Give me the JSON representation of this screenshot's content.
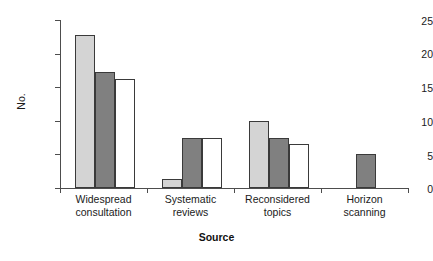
{
  "chart_data": {
    "type": "bar",
    "title": "",
    "xlabel": "Source",
    "ylabel": "No.",
    "ylim": [
      0,
      25
    ],
    "yticks": [
      0,
      5,
      10,
      15,
      20,
      25
    ],
    "ytick_labels": [
      "0",
      "5",
      "10",
      "15",
      "20",
      "25"
    ],
    "grid": false,
    "legend": "none",
    "categories": [
      "Widespread\nconsultation",
      "Systematic\nreviews",
      "Reconsidered\ntopics",
      "Horizon\nscanning"
    ],
    "category_lines": [
      [
        "Widespread",
        "consultation"
      ],
      [
        "Systematic",
        "reviews"
      ],
      [
        "Reconsidered",
        "topics"
      ],
      [
        "Horizon",
        "scanning"
      ]
    ],
    "series": [
      {
        "name": "Series 1",
        "color": "#d4d4d4",
        "values": [
          22.8,
          1.3,
          10.0,
          null
        ]
      },
      {
        "name": "Series 2",
        "color": "#808080",
        "values": [
          17.2,
          7.5,
          7.5,
          5.0
        ]
      },
      {
        "name": "Series 3",
        "color": "#ffffff",
        "values": [
          16.2,
          7.5,
          6.5,
          null
        ]
      }
    ]
  },
  "axis": {
    "y_title": "No.",
    "x_title": "Source"
  }
}
